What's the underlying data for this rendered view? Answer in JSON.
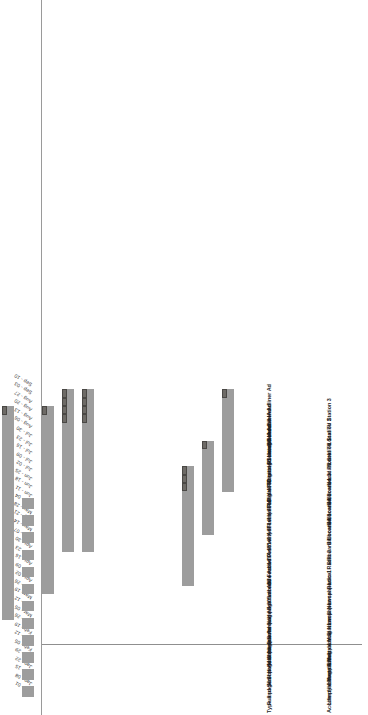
{
  "chart_data": {
    "type": "bar",
    "chart_kind": "gantt",
    "title": "",
    "xlabel": "",
    "ylabel": "",
    "grid": false,
    "legend": null,
    "colors": {
      "bar_fill": "#9d9d9d",
      "bar_cap": "#6d6a66",
      "cap_border": "#4a4845",
      "axis_rule": "#9a9a9a",
      "text": "#1f1f1f",
      "background": "#ffffff"
    },
    "axis_ticks": [
      "Jan - 01",
      "Jan - 08",
      "Jan - 15",
      "Jan - 22",
      "Jan - 29",
      "Feb - 05",
      "Feb - 12",
      "Feb - 19",
      "Feb - 26",
      "Mar - 05",
      "Mar - 12",
      "Mar - 19",
      "Mar - 26",
      "Apr - 02",
      "Apr - 09",
      "Apr - 16",
      "Apr - 23",
      "Apr - 30",
      "May - 07",
      "May - 14",
      "May - 21",
      "May - 28",
      "Jun - 04",
      "Jun - 11",
      "Jun - 18",
      "Jun - 25",
      "Jul - 02",
      "Jul - 09",
      "Jul - 16",
      "Jul - 23",
      "Jul - 30",
      "Aug - 06",
      "Aug - 13",
      "Aug - 20",
      "Aug - 27",
      "Sep - 03",
      "Sep - 10"
    ],
    "categories": [
      "Lifestyle Magazine A",
      "Lifestyle Magazine B",
      "Lifestyle Magazine C",
      "Local Newspaper",
      "Local Newspaper",
      "Local Radio 1",
      "Local Radio 2",
      "Billboard Location 1",
      "Billboard Location 2",
      "Billboard Location 3",
      "Billboard Location 4",
      "Local TV Station 1",
      "Local TV Station 2",
      "Local TV Station 3"
    ],
    "series": [
      {
        "name": "Ad schedule span",
        "values": [
          {
            "start_index": 3,
            "end_index": 22,
            "cap_segments": 1
          },
          {
            "start_index": 5,
            "end_index": 25,
            "cap_segments": 1
          },
          {
            "start_index": 9,
            "end_index": 34,
            "cap_segments": 1
          },
          {
            "start_index": 0,
            "end_index": 22,
            "cap_segments": 0,
            "pattern": "weekly-pulses"
          },
          {
            "start_index": 12,
            "end_index": 34,
            "cap_segments": 1
          },
          {
            "start_index": 17,
            "end_index": 36,
            "cap_segments": 4
          },
          {
            "start_index": 17,
            "end_index": 36,
            "cap_segments": 4
          },
          {
            "start_index": 0,
            "end_index": 0,
            "cap_segments": 0
          },
          {
            "start_index": 0,
            "end_index": 0,
            "cap_segments": 0
          },
          {
            "start_index": 0,
            "end_index": 0,
            "cap_segments": 0
          },
          {
            "start_index": 0,
            "end_index": 0,
            "cap_segments": 0
          },
          {
            "start_index": 13,
            "end_index": 27,
            "cap_segments": 3
          },
          {
            "start_index": 19,
            "end_index": 30,
            "cap_segments": 1
          },
          {
            "start_index": 24,
            "end_index": 36,
            "cap_segments": 1
          }
        ]
      }
    ]
  },
  "table": {
    "headers": {
      "name": "Accomplishment Name",
      "type": "Type and Size of Advertisement"
    },
    "rows": [
      {
        "name": "Lifestyle Magazine A",
        "type": "Full page Schedule Ad"
      },
      {
        "name": "Lifestyle Magazine B",
        "type": "Half page Schedule Ad"
      },
      {
        "name": "Lifestyle Magazine C",
        "type": "Half page Schedule Ad"
      },
      {
        "name": "Local Newspaper",
        "type": "Quarter page Festival Ad"
      },
      {
        "name": "Local Newspaper",
        "type": "Half page Schedule Ad"
      },
      {
        "name": "Local Radio 1",
        "type": "30 second Festival Ad"
      },
      {
        "name": "Local Radio 2",
        "type": "30 second Festival Ad"
      },
      {
        "name": "Billboard Location 1",
        "type": "14' X 48' vinyl  Festival Ad"
      },
      {
        "name": "Billboard Location 2",
        "type": "14' X 48' vinyl  Festival Ad"
      },
      {
        "name": "Billboard Location 3",
        "type": "14' X 48' Digital Rotating Schedule Ad"
      },
      {
        "name": "Billboard Location 4",
        "type": "14' X 48' Digital Rotating Schedule Ad"
      },
      {
        "name": "Local TV Station 1",
        "type": "30 second Headliner Ad"
      },
      {
        "name": "Local TV Station 2",
        "type": "30 second Headliner Ad"
      },
      {
        "name": "Local TV Station 3",
        "type": "30 second Headliner Ad"
      }
    ]
  }
}
